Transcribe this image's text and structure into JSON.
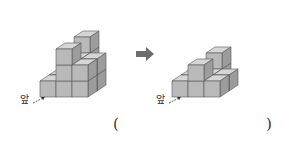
{
  "figures": {
    "before": {
      "front_label": "앞",
      "description": "stacked unit cubes (before)"
    },
    "after": {
      "front_label": "앞",
      "description": "stacked unit cubes (after removing some)"
    }
  },
  "transition_arrow": "➡",
  "answer_blank": {
    "open": "(",
    "close": ")"
  }
}
